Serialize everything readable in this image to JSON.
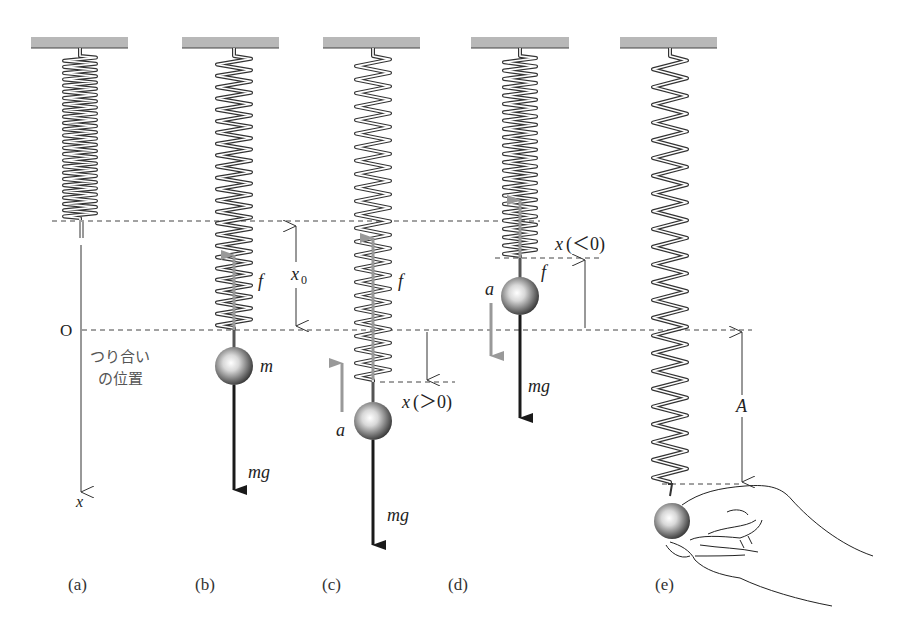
{
  "figure": {
    "colors": {
      "ceiling": "#b8b8b8",
      "spring": "#333333",
      "force_arrow": "#999999",
      "weight_arrow": "#1a1a1a",
      "dashed": "#444444",
      "text": "#222222"
    },
    "panels": [
      {
        "id": "a",
        "label": "(a)",
        "spring_bottom": 220
      },
      {
        "id": "b",
        "label": "(b)",
        "spring_bottom": 330,
        "mass_label": "m",
        "force_label": "f",
        "weight_label": "mg",
        "disp_label": "x",
        "disp_sub": "0"
      },
      {
        "id": "c",
        "label": "(c)",
        "spring_bottom": 382,
        "force_label": "f",
        "weight_label": "mg",
        "accel_label": "a",
        "disp_label": "x",
        "disp_cond": "(＞0)"
      },
      {
        "id": "d",
        "label": "(d)",
        "spring_bottom": 258,
        "force_label": "f",
        "weight_label": "mg",
        "accel_label": "a",
        "disp_label": "x",
        "disp_cond": "(＜0)"
      },
      {
        "id": "e",
        "label": "(e)",
        "spring_bottom": 484,
        "amp_label": "A"
      }
    ],
    "axis": {
      "origin_label": "O",
      "axis_label": "x",
      "equilibrium_label_line1": "つり合い",
      "equilibrium_label_line2": "の位置"
    }
  }
}
